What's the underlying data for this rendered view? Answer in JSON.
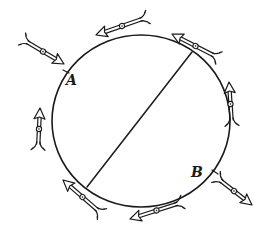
{
  "figure": {
    "colors": {
      "ink": "#1a1a1a",
      "background": "#ffffff"
    },
    "circle": {
      "cx": 141,
      "cy": 121,
      "rx": 89,
      "ry": 86
    },
    "diameter": {
      "x1": 192,
      "y1": 52,
      "x2": 87,
      "y2": 187
    },
    "labels": [
      {
        "text": "A",
        "x": 66,
        "y": 85
      },
      {
        "text": "B",
        "x": 191,
        "y": 177
      }
    ],
    "tick_marks": [
      {
        "x1": 63,
        "y1": 70,
        "x2": 69,
        "y2": 73
      },
      {
        "x1": 212,
        "y1": 170,
        "x2": 218,
        "y2": 174
      }
    ],
    "arrows": [
      {
        "id": "arrow-outer-topleft",
        "tail": [
          22,
          39
        ],
        "head": [
          64,
          64
        ]
      },
      {
        "id": "arrow-top",
        "tail": [
          148,
          17
        ],
        "head": [
          96,
          35
        ]
      },
      {
        "id": "arrow-topright",
        "tail": [
          219,
          58
        ],
        "head": [
          172,
          34
        ]
      },
      {
        "id": "arrow-right",
        "tail": [
          232,
          126
        ],
        "head": [
          229,
          82
        ]
      },
      {
        "id": "arrow-left",
        "tail": [
          38,
          150
        ],
        "head": [
          40,
          108
        ]
      },
      {
        "id": "arrow-bottomleft",
        "tail": [
          102,
          214
        ],
        "head": [
          63,
          180
        ]
      },
      {
        "id": "arrow-bottom",
        "tail": [
          183,
          202
        ],
        "head": [
          130,
          219
        ]
      },
      {
        "id": "arrow-outer-bottomright",
        "tail": [
          216,
          177
        ],
        "head": [
          252,
          205
        ]
      }
    ]
  }
}
